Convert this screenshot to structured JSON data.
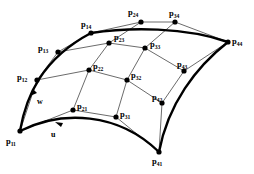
{
  "figure": {
    "background_color": "#ffffff",
    "line_color": "#2b2b2b",
    "boundary_color": "#000000",
    "point_color": "#000000"
  },
  "direction_labels": [
    {
      "id": "w",
      "text": "w",
      "x": 37,
      "y": 98
    },
    {
      "id": "u",
      "text": "u",
      "x": 51,
      "y": 131
    }
  ],
  "control_points": [
    {
      "id": "p11",
      "base": "p",
      "sub": "11",
      "x": 20,
      "y": 131,
      "label_x": 6,
      "label_y": 137
    },
    {
      "id": "p12",
      "base": "p",
      "sub": "12",
      "x": 37,
      "y": 80,
      "label_x": 17,
      "label_y": 73
    },
    {
      "id": "p13",
      "base": "p",
      "sub": "13",
      "x": 58,
      "y": 52,
      "label_x": 38,
      "label_y": 44
    },
    {
      "id": "p14",
      "base": "p",
      "sub": "14",
      "x": 91,
      "y": 33,
      "label_x": 81,
      "label_y": 20
    },
    {
      "id": "p21",
      "base": "p",
      "sub": "21",
      "x": 73,
      "y": 110,
      "label_x": 77,
      "label_y": 102
    },
    {
      "id": "p22",
      "base": "p",
      "sub": "22",
      "x": 89,
      "y": 70,
      "label_x": 93,
      "label_y": 62
    },
    {
      "id": "p23",
      "base": "p",
      "sub": "23",
      "x": 109,
      "y": 43,
      "label_x": 114,
      "label_y": 33
    },
    {
      "id": "p24",
      "base": "p",
      "sub": "24",
      "x": 141,
      "y": 22,
      "label_x": 128,
      "label_y": 8
    },
    {
      "id": "p31",
      "base": "p",
      "sub": "31",
      "x": 116,
      "y": 117,
      "label_x": 120,
      "label_y": 110
    },
    {
      "id": "p32",
      "base": "p",
      "sub": "32",
      "x": 127,
      "y": 80,
      "label_x": 131,
      "label_y": 71
    },
    {
      "id": "p33",
      "base": "p",
      "sub": "33",
      "x": 145,
      "y": 48,
      "label_x": 150,
      "label_y": 40
    },
    {
      "id": "p34",
      "base": "p",
      "sub": "34",
      "x": 175,
      "y": 22,
      "label_x": 169,
      "label_y": 9
    },
    {
      "id": "p41",
      "base": "p",
      "sub": "41",
      "x": 159,
      "y": 152,
      "label_x": 152,
      "label_y": 157
    },
    {
      "id": "p42",
      "base": "p",
      "sub": "42",
      "x": 162,
      "y": 103,
      "label_x": 152,
      "label_y": 93
    },
    {
      "id": "p43",
      "base": "p",
      "sub": "43",
      "x": 184,
      "y": 71,
      "label_x": 177,
      "label_y": 60
    },
    {
      "id": "p44",
      "base": "p",
      "sub": "44",
      "x": 228,
      "y": 42,
      "label_x": 232,
      "label_y": 37
    }
  ],
  "net_rows": [
    {
      "id": "row-1",
      "points": [
        "p11",
        "p12",
        "p13",
        "p14"
      ]
    },
    {
      "id": "row-2",
      "points": [
        "p21",
        "p22",
        "p23",
        "p24"
      ]
    },
    {
      "id": "row-3",
      "points": [
        "p31",
        "p32",
        "p33",
        "p34"
      ]
    },
    {
      "id": "row-4",
      "points": [
        "p41",
        "p42",
        "p43",
        "p44"
      ]
    }
  ],
  "net_cols": [
    {
      "id": "col-1",
      "points": [
        "p11",
        "p21",
        "p31",
        "p41"
      ]
    },
    {
      "id": "col-2",
      "points": [
        "p12",
        "p22",
        "p32",
        "p42"
      ]
    },
    {
      "id": "col-3",
      "points": [
        "p13",
        "p23",
        "p33",
        "p43"
      ]
    },
    {
      "id": "col-4",
      "points": [
        "p14",
        "p24",
        "p34",
        "p44"
      ]
    }
  ],
  "boundary_curves": [
    {
      "id": "curve-w-left",
      "from": "p11",
      "to": "p14",
      "style": "thick"
    },
    {
      "id": "curve-u-bottom",
      "from": "p11",
      "to": "p41",
      "style": "thick"
    },
    {
      "id": "curve-top",
      "from": "p14",
      "to": "p44",
      "style": "thick"
    },
    {
      "id": "curve-right",
      "from": "p41",
      "to": "p44",
      "style": "thick"
    }
  ]
}
